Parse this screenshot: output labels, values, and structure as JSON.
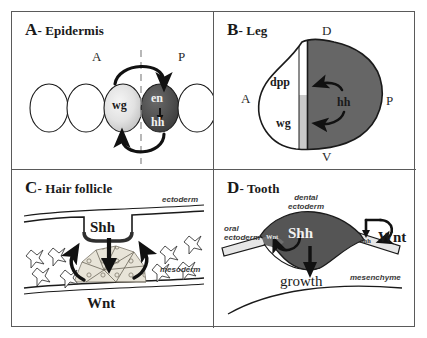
{
  "figure": {
    "panels": [
      {
        "id": "A",
        "letter": "A",
        "title_rest": "- Epidermis",
        "full_title": "A - Epidermis",
        "axes": {
          "anterior": "A",
          "posterior": "P"
        },
        "cells": [
          {
            "label": "wg",
            "fill": "light-gradient"
          },
          {
            "label": "en",
            "fill": "dark-gray"
          },
          {
            "label": "hh",
            "fill": "dark-gray"
          }
        ],
        "genes": [
          "wg",
          "en",
          "hh"
        ]
      },
      {
        "id": "B",
        "letter": "B",
        "title_rest": "- Leg",
        "full_title": "B - Leg",
        "axes": {
          "dorsal": "D",
          "ventral": "V",
          "anterior": "A",
          "posterior": "P"
        },
        "genes": [
          "dpp",
          "hh",
          "wg"
        ],
        "labels": {
          "dpp": "dpp",
          "hh": "hh",
          "wg": "wg"
        }
      },
      {
        "id": "C",
        "letter": "C",
        "title_rest": "- Hair follicle",
        "full_title": "C - Hair follicle",
        "tissues": {
          "top": "ectoderm",
          "bottom": "mesoderm"
        },
        "signals": {
          "top": "Shh",
          "bottom": "Wnt"
        }
      },
      {
        "id": "D",
        "letter": "D",
        "title_rest": "- Tooth",
        "full_title": "D - Tooth",
        "tissues": {
          "oral": "oral\nectoderm",
          "oral_line1": "oral",
          "oral_line2": "ectoderm",
          "dental_line1": "dental",
          "dental_line2": "ectoderm",
          "mesenchyme": "mesenchyme"
        },
        "signals": {
          "shh_main": "Shh",
          "wnt_main": "Wnt",
          "wnt_small": "Wnt",
          "shh_small": "Shh",
          "growth": "growth"
        }
      }
    ],
    "colors": {
      "border": "#5a5a5a",
      "ink": "#1a1a1a",
      "dark_cell": "#4a4a4a",
      "light_cell": "#e0e0e0",
      "mid_gray": "#a8a8a8",
      "pale_gray": "#d6d6d6",
      "background": "#ffffff"
    }
  }
}
